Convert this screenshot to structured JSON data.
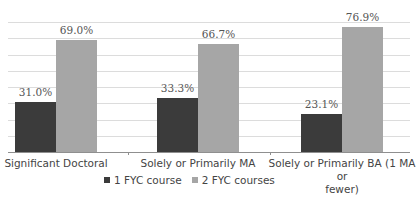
{
  "chart_data": {
    "type": "bar",
    "title": "",
    "xlabel": "",
    "ylabel": "",
    "ylim": [
      0,
      80
    ],
    "grid": true,
    "gridlines_at": [
      10,
      20,
      30,
      40,
      50,
      60,
      70,
      80
    ],
    "legend_position": "bottom",
    "categories": [
      "Significant Doctoral",
      "Solely or Primarily MA",
      "Solely or Primarily BA (1 MA or fewer)"
    ],
    "category_label_lines": [
      [
        "Significant Doctoral"
      ],
      [
        "Solely or Primarily MA"
      ],
      [
        "Solely or Primarily BA (1 MA or",
        "fewer)"
      ]
    ],
    "series": [
      {
        "name": "1 FYC course",
        "color": "#3b3b3b",
        "values": [
          31.0,
          33.3,
          23.1
        ],
        "labels": [
          "31.0%",
          "33.3%",
          "23.1%"
        ]
      },
      {
        "name": "2 FYC courses",
        "color": "#a6a6a6",
        "values": [
          69.0,
          66.7,
          76.9
        ],
        "labels": [
          "69.0%",
          "66.7%",
          "76.9%"
        ]
      }
    ]
  }
}
